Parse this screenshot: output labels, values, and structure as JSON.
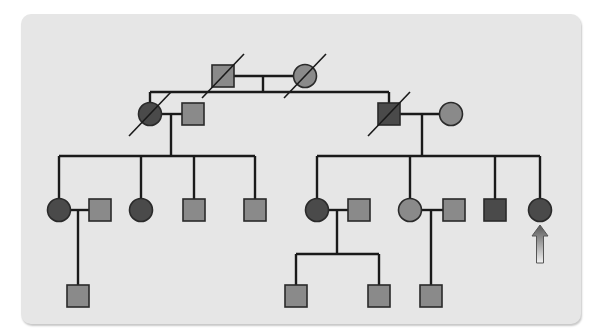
{
  "colors": {
    "panel": "#e6e6e6",
    "line": "#1a1a1a",
    "affected": "#4a4a4a",
    "unaffected": "#8a8a8a",
    "arrow_top": "#555555",
    "arrow_bottom": "#f2f2f2"
  },
  "legend_semantics": {
    "square": "male",
    "circle": "female",
    "dark_fill": "affected",
    "light_fill": "unaffected",
    "slash": "deceased",
    "arrow": "proband"
  },
  "generations": [
    {
      "label": "I",
      "individuals": [
        {
          "id": "I-1",
          "sex": "male",
          "affected": false,
          "deceased": true
        },
        {
          "id": "I-2",
          "sex": "female",
          "affected": false,
          "deceased": true
        }
      ]
    },
    {
      "label": "II",
      "individuals": [
        {
          "id": "II-1",
          "sex": "female",
          "affected": true,
          "deceased": true,
          "parents": "I-1+I-2"
        },
        {
          "id": "II-2",
          "sex": "male",
          "affected": false,
          "deceased": false,
          "spouse_of": "II-1"
        },
        {
          "id": "II-3",
          "sex": "male",
          "affected": true,
          "deceased": true,
          "parents": "I-1+I-2"
        },
        {
          "id": "II-4",
          "sex": "female",
          "affected": false,
          "deceased": false,
          "spouse_of": "II-3"
        }
      ]
    },
    {
      "label": "III",
      "individuals": [
        {
          "id": "III-1",
          "sex": "female",
          "affected": true,
          "deceased": false,
          "parents": "II-1+II-2"
        },
        {
          "id": "III-2",
          "sex": "male",
          "affected": false,
          "deceased": false,
          "spouse_of": "III-1"
        },
        {
          "id": "III-3",
          "sex": "female",
          "affected": true,
          "deceased": false,
          "parents": "II-1+II-2"
        },
        {
          "id": "III-4",
          "sex": "male",
          "affected": false,
          "deceased": false,
          "parents": "II-1+II-2"
        },
        {
          "id": "III-5",
          "sex": "male",
          "affected": false,
          "deceased": false,
          "parents": "II-1+II-2"
        },
        {
          "id": "III-6",
          "sex": "female",
          "affected": true,
          "deceased": false,
          "parents": "II-3+II-4"
        },
        {
          "id": "III-7",
          "sex": "male",
          "affected": false,
          "deceased": false,
          "spouse_of": "III-6"
        },
        {
          "id": "III-8",
          "sex": "female",
          "affected": false,
          "deceased": false,
          "parents": "II-3+II-4"
        },
        {
          "id": "III-9",
          "sex": "male",
          "affected": false,
          "deceased": false,
          "spouse_of": "III-8"
        },
        {
          "id": "III-10",
          "sex": "male",
          "affected": true,
          "deceased": false,
          "parents": "II-3+II-4"
        },
        {
          "id": "III-11",
          "sex": "female",
          "affected": true,
          "deceased": false,
          "parents": "II-3+II-4",
          "proband": true
        }
      ]
    },
    {
      "label": "IV",
      "individuals": [
        {
          "id": "IV-1",
          "sex": "male",
          "affected": false,
          "deceased": false,
          "parents": "III-1+III-2"
        },
        {
          "id": "IV-2",
          "sex": "male",
          "affected": false,
          "deceased": false,
          "parents": "III-6+III-7"
        },
        {
          "id": "IV-3",
          "sex": "male",
          "affected": false,
          "deceased": false,
          "parents": "III-6+III-7"
        },
        {
          "id": "IV-4",
          "sex": "male",
          "affected": false,
          "deceased": false,
          "parents": "III-8+III-9"
        }
      ]
    }
  ]
}
